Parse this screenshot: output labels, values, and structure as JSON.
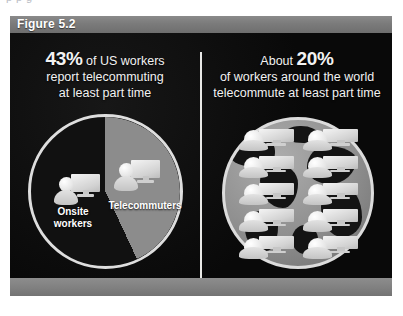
{
  "page": {
    "cropped_text_above": "p    p                                      g"
  },
  "figure": {
    "header_label": "Figure 5.2",
    "colors": {
      "header_bar": "#7b7b7b",
      "body_background": "#0a0a0a",
      "divider": "#e8e8e6",
      "telecommuters_slice": "#8c8c8c",
      "onsite_slice": "#111111",
      "globe_ocean": "#8e8e8e",
      "globe_land": "#141414",
      "text": "#f2f2f2"
    },
    "panels": [
      {
        "name": "us-workers-panel",
        "headline": {
          "lines": [
            {
              "emphasis": "43%",
              "text": " of US workers"
            },
            {
              "emphasis": "",
              "text": "report telecommuting"
            },
            {
              "emphasis": "",
              "text": "at least part time"
            }
          ]
        },
        "chart": {
          "type": "pie",
          "labels": {
            "onsite": "Onsite\nworkers",
            "onsite_line_1": "Onsite",
            "onsite_line_2": "workers",
            "telecommuters": "Telecommuters"
          },
          "icons": {
            "onsite": "person-computer-icon",
            "telecommuters": "person-computer-icon"
          }
        }
      },
      {
        "name": "world-workers-panel",
        "headline": {
          "lines": [
            {
              "emphasis": "20%",
              "text": "About "
            },
            {
              "emphasis": "",
              "text": "of workers around the world"
            },
            {
              "emphasis": "",
              "text": "telecommute at least part time"
            }
          ]
        },
        "chart": {
          "type": "pictogram",
          "icon": "person-computer-icon",
          "icon_count": 10,
          "columns": 2,
          "rows": 5,
          "background": "globe-icon"
        }
      }
    ]
  },
  "chart_data": [
    {
      "type": "pie",
      "title": "43% of US workers report telecommuting at least part time",
      "categories": [
        "Telecommuters",
        "Onsite workers"
      ],
      "values": [
        43,
        57
      ],
      "unit": "%",
      "colors": [
        "#8c8c8c",
        "#111111"
      ],
      "start_angle_deg": 0,
      "telecommuters_sweep_deg": 155,
      "legend": "in-slice labels",
      "grid": false
    },
    {
      "type": "pictogram",
      "title": "About 20% of workers around the world telecommute at least part time",
      "categories": [
        "World workers who telecommute at least part time"
      ],
      "values": [
        20
      ],
      "unit": "%",
      "icon_total": 10,
      "icon_rows": 5,
      "icon_columns": 2,
      "background": "globe",
      "grid": false
    }
  ]
}
